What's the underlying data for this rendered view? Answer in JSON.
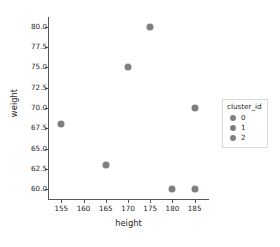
{
  "chart_data": {
    "type": "scatter",
    "title": "",
    "xlabel": "height",
    "ylabel": "weight",
    "xlim": [
      152.0,
      188.0
    ],
    "ylim": [
      58.8,
      81.2
    ],
    "xticks": [
      155,
      160,
      165,
      170,
      175,
      180,
      185
    ],
    "xtick_labels": [
      "155",
      "160",
      "165",
      "170",
      "175",
      "180",
      "185"
    ],
    "yticks": [
      60.0,
      62.5,
      65.0,
      67.5,
      70.0,
      72.5,
      75.0,
      77.5,
      80.0
    ],
    "ytick_labels": [
      "60.0",
      "62.5",
      "65.0",
      "67.5",
      "70.0",
      "72.5",
      "75.0",
      "77.5",
      "80.0"
    ],
    "grid": false,
    "marker_color": "#808080",
    "points": [
      {
        "x": 155,
        "y": 68,
        "cluster_id": 0
      },
      {
        "x": 165,
        "y": 63,
        "cluster_id": 0
      },
      {
        "x": 170,
        "y": 75,
        "cluster_id": 1
      },
      {
        "x": 175,
        "y": 80,
        "cluster_id": 1
      },
      {
        "x": 180,
        "y": 60,
        "cluster_id": 2
      },
      {
        "x": 185,
        "y": 60,
        "cluster_id": 2
      },
      {
        "x": 185,
        "y": 70,
        "cluster_id": 2
      }
    ],
    "legend": {
      "position": "right",
      "title": "cluster_id",
      "entries": [
        {
          "label": "0",
          "color": "#808080"
        },
        {
          "label": "1",
          "color": "#808080"
        },
        {
          "label": "2",
          "color": "#808080"
        }
      ]
    }
  }
}
